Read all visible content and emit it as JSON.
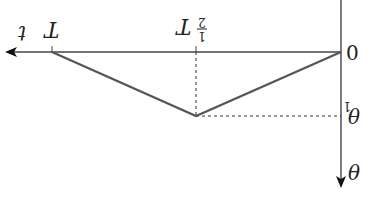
{
  "diagram": {
    "orientation": "rotated 180 degrees",
    "axes": {
      "horizontal": {
        "label": "t",
        "origin_label": "0"
      },
      "vertical": {
        "label": "θ"
      }
    },
    "ticks": {
      "half_period": {
        "label_var": "T",
        "label_frac_num": "1",
        "label_frac_den": "2"
      },
      "period": {
        "label": "T"
      }
    },
    "levels": {
      "theta1": {
        "label_var": "θ",
        "label_sub": "1"
      }
    },
    "curve": {
      "points": [
        [
          "0",
          "0"
        ],
        [
          "T/2",
          "θ1"
        ],
        [
          "T",
          "0"
        ]
      ],
      "color": "#555555"
    }
  }
}
